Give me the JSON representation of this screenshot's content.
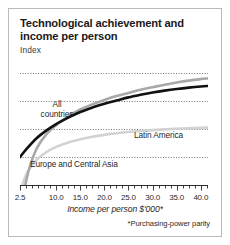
{
  "chart_data": {
    "type": "line",
    "title": "Technological achievement and income per person",
    "subtitle": "Index",
    "xlabel": "Income per person $'000*",
    "ylabel": "Index",
    "footnote": "*Purchasing-power parity",
    "xlim": [
      2.5,
      41.5
    ],
    "ylim": [
      0,
      100
    ],
    "grid": "horizontal-dotted",
    "gridlines_y": [
      22,
      44,
      66,
      88
    ],
    "legend_position": "inline-annotations",
    "xticklabels": [
      "2.5",
      "10.0",
      "15.0",
      "20.0",
      "25.0",
      "30.0",
      "35.0",
      "40.0"
    ],
    "xtickvalues": [
      2.5,
      10.0,
      15.0,
      20.0,
      25.0,
      30.0,
      35.0,
      40.0
    ],
    "minor_tick_step": 1.25,
    "series": [
      {
        "name": "All countries",
        "color": "#111111",
        "width": 2.6,
        "x": [
          2.5,
          4,
          6,
          8,
          10,
          12.5,
          15,
          17.5,
          20,
          22.5,
          25,
          27.5,
          30,
          32.5,
          35,
          37.5,
          40,
          41.5
        ],
        "values": [
          22,
          29,
          37,
          43,
          48,
          53,
          57.5,
          61,
          64,
          66.5,
          69,
          71,
          72.8,
          74.3,
          75.6,
          76.7,
          77.6,
          78
        ]
      },
      {
        "name": "Europe and Central Asia",
        "color": "#a8a8a8",
        "width": 2.6,
        "x": [
          3.6,
          4.5,
          6,
          8,
          10,
          12.5,
          15,
          17.5,
          20,
          22.5,
          25,
          27.5,
          30,
          32.5,
          35,
          37.5,
          40,
          41.5
        ],
        "values": [
          0,
          14,
          29,
          40,
          47,
          54,
          59.5,
          63.5,
          67,
          70,
          72.5,
          75,
          77,
          79,
          80.7,
          82.2,
          83.4,
          84
        ]
      },
      {
        "name": "Latin America",
        "color": "#d2d2d2",
        "width": 2.6,
        "x": [
          3.0,
          4,
          6,
          8,
          10,
          12.5,
          15,
          17.5,
          20,
          22.5,
          25,
          27.5,
          30,
          32.5,
          35,
          37.5,
          40,
          41.5
        ],
        "values": [
          0,
          10,
          20,
          26,
          30,
          33.5,
          36,
          38,
          39.5,
          40.7,
          41.7,
          42.5,
          43.2,
          43.8,
          44.3,
          44.7,
          45,
          45.2
        ]
      }
    ],
    "annotations": [
      {
        "name": "All countries",
        "text": "All countries"
      },
      {
        "name": "Latin America",
        "text": "Latin America"
      },
      {
        "name": "Europe and Central Asia",
        "text": "Europe and Central Asia"
      }
    ]
  },
  "figure": {
    "title": "Technological achievement and income per person",
    "subtitle": "Index",
    "xlabel": "Income per person $'000*",
    "footnote": "*Purchasing-power parity",
    "label_all": "All countries",
    "label_latam": "Latin America",
    "label_europe": "Europe and Central Asia"
  },
  "colors": {
    "border": "#b9b9b9",
    "background": "#ffffff",
    "text": "#1a1a1a",
    "grid": "#4d4d4d",
    "series_all": "#111111",
    "series_europe": "#a8a8a8",
    "series_latam": "#d2d2d2"
  }
}
